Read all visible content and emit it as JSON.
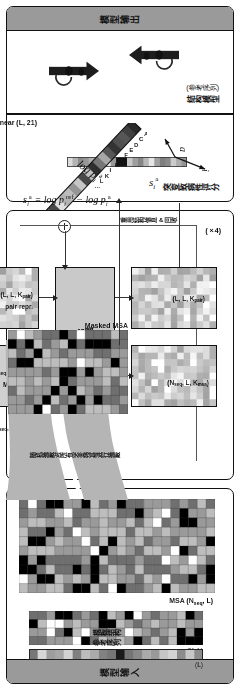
{
  "figure": {
    "type": "architecture-diagram",
    "orientation": "landscape content rotated 90 degrees inside portrait frame",
    "panels": [
      {
        "id": "input",
        "band_title": "模型输入"
      },
      {
        "id": "trunk",
        "band_title": ""
      },
      {
        "id": "output",
        "band_title": "模型输出"
      }
    ]
  },
  "input_panel": {
    "band_title": "模型输入",
    "ref_seq_label": "参考序列",
    "ref_seq_dims": "(L)",
    "template_label": "模板结构",
    "template_dims": "(N, L)",
    "msa_label": "MSA (N_seq, L)",
    "msa_label_plain": "MSA (N",
    "msa_label_sub": "seq",
    "msa_label_tail": ", L)"
  },
  "masking": {
    "mask_all_variants": "对所有突变残基进行掩蔽",
    "random_mask": "随机掩蔽",
    "masked_msa_label": "Masked MSA"
  },
  "trunk_panel": {
    "recycle_label": "重用结构信息 & 回收",
    "recycle_count": "(×4)",
    "evoformer_layers": "48层",
    "evoformer_name": "Evoformer",
    "pair_repr_label": "pair repr.",
    "pair_repr_dims": "(L, L, K_pair)",
    "msa_repr_label": "MSA repr.",
    "msa_repr_dims": "(N_seq, L, K_msa)",
    "linear_msa": "Linear (N_seq, L, K_msa)",
    "out_pair_dims": "(L, L, K_pair)",
    "out_msa_dims": "(N_seq, L, K_msa)"
  },
  "output_panel": {
    "band_title": "模型输出",
    "structure_label": "结构模型",
    "structure_sub": "(参考序列)",
    "score_label": "突变致病性评分",
    "score_symbol": "s_i^a",
    "linear_label": "Linear (L, 21)",
    "axis_logp": "log p_i^a",
    "axis_a": "a",
    "axis_i": "i",
    "formula": "s_i^a = log p_i^ref − log p_i^a",
    "amino_acids": [
      "A",
      "C",
      "D",
      "E",
      "F",
      "G",
      "H",
      "I",
      "K",
      "L",
      "..."
    ]
  },
  "colors": {
    "band": "#9a9a9a",
    "panel_border": "#111111",
    "evoformer": "#c9c9c9",
    "box_fill": "#d9d9d9",
    "connector_blob": "#b9b9b9",
    "line": "#333333"
  }
}
